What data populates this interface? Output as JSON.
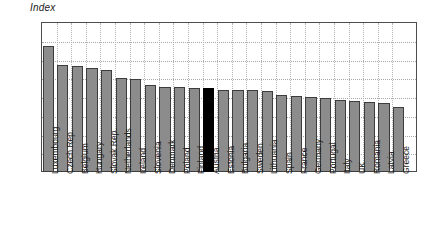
{
  "chart_data": {
    "type": "bar",
    "title": "",
    "ylabel": "Index",
    "xlabel": "",
    "ylim": [
      0.0,
      0.8
    ],
    "yticks": [
      "0.0",
      "0.1",
      "0.2",
      "0.3",
      "0.4",
      "0.5",
      "0.6",
      "0.7",
      "0.8"
    ],
    "ytick_values": [
      0.0,
      0.1,
      0.2,
      0.3,
      0.4,
      0.5,
      0.6,
      0.7,
      0.8
    ],
    "grid": "both-dotted",
    "legend": "none",
    "highlight_category": "Austria",
    "highlight_color": "#000000",
    "bar_color": "#8c8c8c",
    "bar_edge_color": "#3d3d3d",
    "categories": [
      "Luxembourg",
      "Czech Rep.",
      "Belgium",
      "Hungary",
      "Slovak Rep.",
      "Netherlands",
      "Ireland",
      "Slovenia",
      "Denmark",
      "Poland",
      "Finland",
      "Austria",
      "Estonia",
      "Bulgaria",
      "Sweden",
      "Lithuania",
      "Spain",
      "France",
      "Germany",
      "Portugal",
      "Italy",
      "UK",
      "Romania",
      "Latvia",
      "Greece"
    ],
    "values": [
      0.67,
      0.57,
      0.565,
      0.555,
      0.545,
      0.5,
      0.495,
      0.465,
      0.455,
      0.455,
      0.45,
      0.448,
      0.44,
      0.435,
      0.435,
      0.43,
      0.41,
      0.405,
      0.4,
      0.395,
      0.385,
      0.38,
      0.375,
      0.37,
      0.345
    ]
  }
}
